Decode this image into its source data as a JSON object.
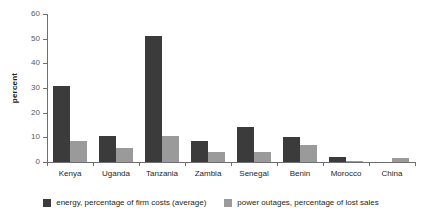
{
  "chart_data": {
    "type": "bar",
    "title": "",
    "subtitle": "",
    "xlabel": "",
    "ylabel": "percent",
    "ylim": [
      0,
      60
    ],
    "yticks": [
      0,
      10,
      20,
      30,
      40,
      50,
      60
    ],
    "ytick_labels": [
      "0",
      "10",
      "20",
      "30",
      "40",
      "50",
      "60"
    ],
    "grid": false,
    "legend_position": "bottom",
    "categories": [
      "Kenya",
      "Uganda",
      "Tanzania",
      "Zambia",
      "Senegal",
      "Benin",
      "Morocco",
      "China"
    ],
    "series": [
      {
        "name": "energy, percentage of firm costs (average)",
        "color": "#3b3b3b",
        "values": [
          31,
          10.5,
          51,
          8.5,
          14,
          10,
          2,
          0
        ]
      },
      {
        "name": "power outages, percentage of lost sales",
        "color": "#9a9a9a",
        "values": [
          8.5,
          5.5,
          10.5,
          4,
          4,
          7,
          0.5,
          1.5
        ]
      }
    ]
  },
  "axis": {
    "line_color": "#6d6e71",
    "tick_text_color": "#58595b"
  }
}
